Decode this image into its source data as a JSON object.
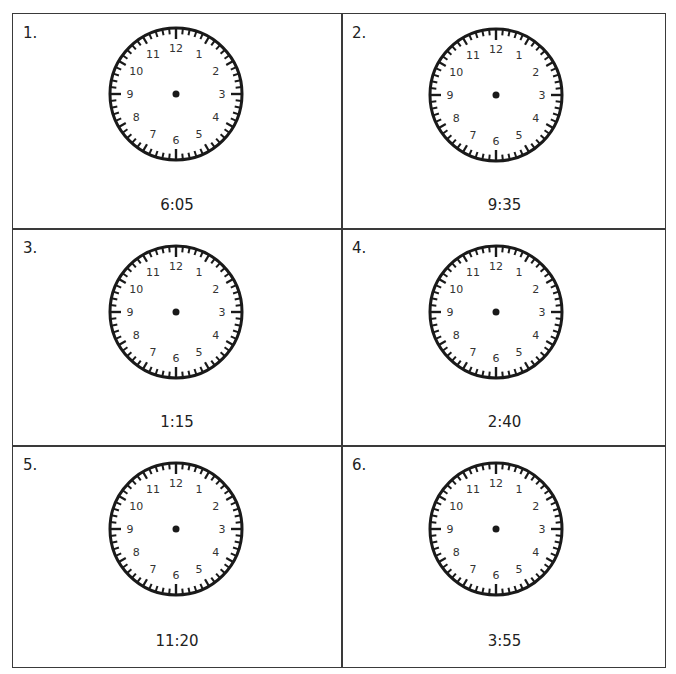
{
  "worksheet": {
    "problems": [
      {
        "number": "1.",
        "time": "6:05"
      },
      {
        "number": "2.",
        "time": "9:35"
      },
      {
        "number": "3.",
        "time": "1:15"
      },
      {
        "number": "4.",
        "time": "2:40"
      },
      {
        "number": "5.",
        "time": "11:20"
      },
      {
        "number": "6.",
        "time": "3:55"
      }
    ],
    "clock_numerals": [
      "12",
      "1",
      "2",
      "3",
      "4",
      "5",
      "6",
      "7",
      "8",
      "9",
      "10",
      "11"
    ]
  },
  "colors": {
    "ink": "#1a1a1a",
    "border": "#3a3a3a",
    "paper": "#ffffff"
  }
}
